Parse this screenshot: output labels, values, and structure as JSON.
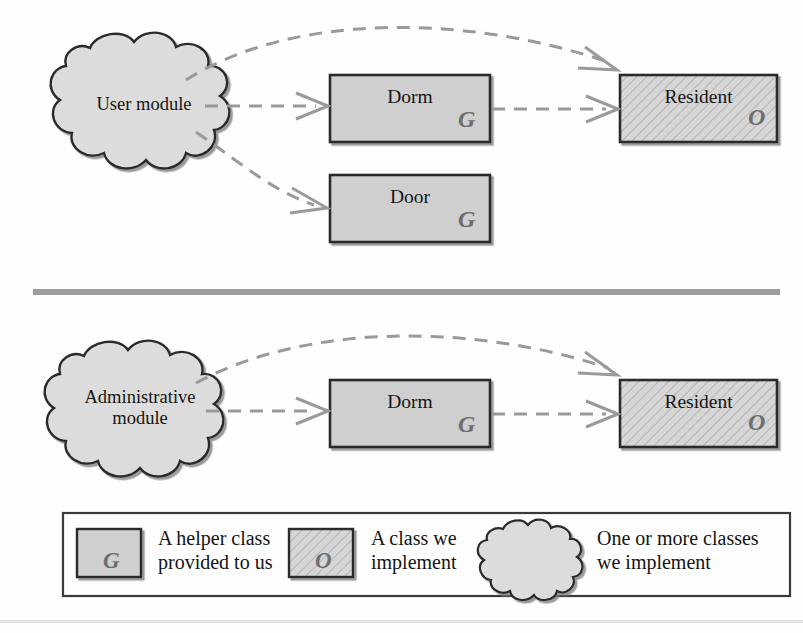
{
  "figure": {
    "type": "module-dependency-diagram",
    "title": "",
    "colors": {
      "box_fill": "#cfcfcf",
      "box_fill_hatched": "#d2d2d2",
      "cloud_fill": "#dcdcdc",
      "box_stroke": "#2b2b2b",
      "arrow_stroke": "#9a9a9a",
      "divider": "#9d9d9d",
      "legend_border": "#3a3a3a",
      "marker_color": "#6e6e6e",
      "text": "#141414"
    }
  },
  "diagrams": [
    {
      "id": "user-module-diagram",
      "cloud": {
        "label": "User module"
      },
      "nodes": [
        {
          "id": "dorm",
          "label": "Dorm",
          "marker": "G",
          "style": "helper"
        },
        {
          "id": "door",
          "label": "Door",
          "marker": "G",
          "style": "helper"
        },
        {
          "id": "resident",
          "label": "Resident",
          "marker": "O",
          "style": "implemented"
        }
      ],
      "edges": [
        {
          "from": "User module",
          "to": "Resident",
          "style": "dashed-curved"
        },
        {
          "from": "User module",
          "to": "Dorm",
          "style": "dashed-straight"
        },
        {
          "from": "User module",
          "to": "Door",
          "style": "dashed-curved"
        },
        {
          "from": "Dorm",
          "to": "Resident",
          "style": "dashed-straight"
        }
      ]
    },
    {
      "id": "administrative-module-diagram",
      "cloud": {
        "label": "Administrative\nmodule"
      },
      "nodes": [
        {
          "id": "dorm2",
          "label": "Dorm",
          "marker": "G",
          "style": "helper"
        },
        {
          "id": "resident2",
          "label": "Resident",
          "marker": "O",
          "style": "implemented"
        }
      ],
      "edges": [
        {
          "from": "Administrative module",
          "to": "Resident",
          "style": "dashed-curved"
        },
        {
          "from": "Administrative module",
          "to": "Dorm",
          "style": "dashed-straight"
        },
        {
          "from": "Dorm",
          "to": "Resident",
          "style": "dashed-straight"
        }
      ]
    }
  ],
  "legend": {
    "items": [
      {
        "id": "helper-class",
        "swatch": "box-plain",
        "marker": "G",
        "label": "A helper class\nprovided to us"
      },
      {
        "id": "implemented-class",
        "swatch": "box-hatched",
        "marker": "O",
        "label": "A class we\nimplement"
      },
      {
        "id": "implemented-module",
        "swatch": "cloud",
        "marker": "",
        "label": "One or more classes\nwe implement"
      }
    ]
  }
}
